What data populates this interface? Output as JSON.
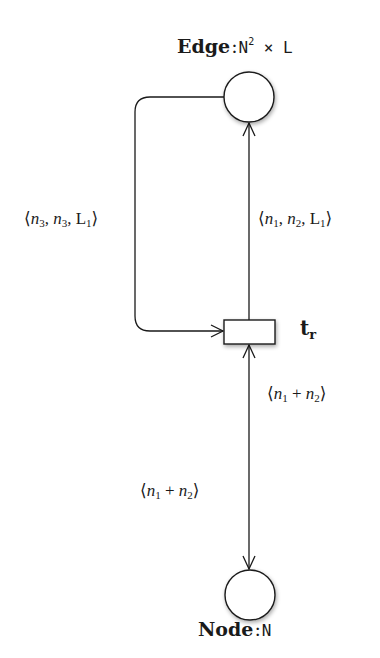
{
  "places": {
    "edge": {
      "name": "Edge",
      "colon": ":",
      "type_base": "N",
      "type_exp": "2",
      "type_rest": " × L"
    },
    "node": {
      "name": "Node",
      "colon": ":",
      "type": "N"
    }
  },
  "transition": {
    "name_base": "t",
    "name_sub": "r"
  },
  "arcs": {
    "left_loop": {
      "open": "⟨",
      "v1": "n",
      "v1_sub": "3",
      "sep1": ", ",
      "v2": "n",
      "v2_sub": "3",
      "sep2": ", ",
      "v3": "L",
      "v3_sub": "1",
      "close": "⟩"
    },
    "to_edge": {
      "open": "⟨",
      "v1": "n",
      "v1_sub": "1",
      "sep1": ", ",
      "v2": "n",
      "v2_sub": "2",
      "sep2": ", ",
      "v3": "L",
      "v3_sub": "1",
      "close": "⟩"
    },
    "node_in": {
      "open": "⟨",
      "v1": "n",
      "v1_sub": "1",
      "op": " + ",
      "v2": "n",
      "v2_sub": "2",
      "close": "⟩"
    },
    "node_out": {
      "open": "⟨",
      "v1": "n",
      "v1_sub": "1",
      "op": " + ",
      "v2": "n",
      "v2_sub": "2",
      "close": "⟩"
    }
  },
  "colors": {
    "stroke": "#1a1a1a",
    "fill": "#ffffff",
    "background": "#ffffff"
  }
}
